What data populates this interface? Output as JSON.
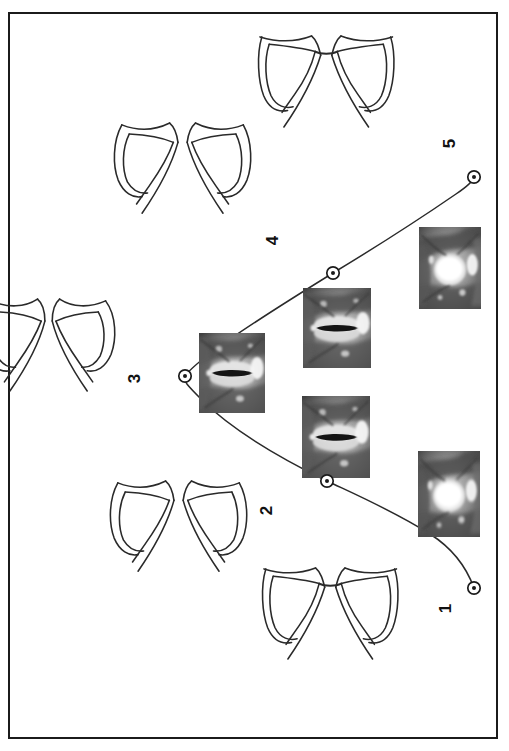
{
  "figure": {
    "type": "patent-figure",
    "orientation": "rotated-90-ccw",
    "border_color": "#1b1b1b",
    "background_color": "#ffffff",
    "line_color": "#2a2a2a",
    "width": 509,
    "height": 751
  },
  "stages": [
    {
      "id": 1,
      "label": "1",
      "label_x": 449,
      "label_y": 608,
      "marker_x": 474,
      "marker_y": 588,
      "drawing_name": "vocal-cords-fully-abducted",
      "photo_name": "laryngoscopy-photo-open-glottis",
      "glottis_opening": "wide-open"
    },
    {
      "id": 2,
      "label": "2",
      "label_x": 269,
      "label_y": 510,
      "marker_x": 327,
      "marker_y": 481,
      "drawing_name": "vocal-cords-partly-abducted",
      "photo_name": "laryngoscopy-photo-narrow-glottis",
      "glottis_opening": "narrow-slit"
    },
    {
      "id": 3,
      "label": "3",
      "label_x": 137,
      "label_y": 378,
      "marker_x": 185,
      "marker_y": 376,
      "drawing_name": "vocal-cords-adducted-phonation",
      "photo_name": "laryngoscopy-photo-closed-glottis",
      "glottis_opening": "closed-slit"
    },
    {
      "id": 4,
      "label": "4",
      "label_x": 275,
      "label_y": 240,
      "marker_x": 333,
      "marker_y": 273,
      "drawing_name": "vocal-cords-partly-abducted-return",
      "photo_name": "laryngoscopy-photo-narrow-glottis-return",
      "glottis_opening": "narrow-slit"
    },
    {
      "id": 5,
      "label": "5",
      "label_x": 452,
      "label_y": 143,
      "marker_x": 474,
      "marker_y": 177,
      "drawing_name": "vocal-cords-fully-abducted-return",
      "photo_name": "laryngoscopy-photo-open-glottis-return",
      "glottis_opening": "wide-open"
    }
  ],
  "trajectory": {
    "name": "glottis-opening-cycle-curve",
    "description": "parabolic path connecting stage markers 1 through 5",
    "stroke_color": "#2a2a2a",
    "stroke_width": 1.4
  },
  "markers": {
    "style": "circle-with-center-dot",
    "outer_radius": 6,
    "inner_radius": 2,
    "stroke_color": "#1b1b1b",
    "fill_color": "#ffffff"
  },
  "photos": [
    {
      "id": "photo-1",
      "x": 418,
      "y": 451,
      "w": 62,
      "h": 86,
      "stage": 1
    },
    {
      "id": "photo-2",
      "x": 302,
      "y": 396,
      "w": 68,
      "h": 82,
      "stage": 2
    },
    {
      "id": "photo-3",
      "x": 199,
      "y": 333,
      "w": 66,
      "h": 80,
      "stage": 3
    },
    {
      "id": "photo-4",
      "x": 303,
      "y": 288,
      "w": 68,
      "h": 80,
      "stage": 4
    },
    {
      "id": "photo-5",
      "x": 419,
      "y": 227,
      "w": 62,
      "h": 82,
      "stage": 5
    }
  ]
}
